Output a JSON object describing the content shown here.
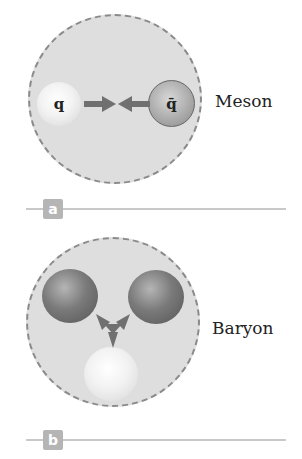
{
  "panels": [
    {
      "id": "a",
      "tag": "a",
      "label": "Meson",
      "quarks": [
        {
          "symbol": "q",
          "shade": "light"
        },
        {
          "symbol": "q̄",
          "shade": "mid"
        }
      ],
      "arrows": "two arrows pointing toward each other"
    },
    {
      "id": "b",
      "tag": "b",
      "label": "Baryon",
      "quarks": [
        {
          "symbol": "",
          "shade": "dark"
        },
        {
          "symbol": "",
          "shade": "dark"
        },
        {
          "symbol": "",
          "shade": "light"
        }
      ],
      "arrows": "three arrows pointing to center"
    }
  ],
  "colors": {
    "hadron_fill": "#dedede",
    "hadron_border": "#8a8a8a",
    "arrow": "#707070",
    "tag_bg": "#b5b5b5",
    "rule": "#c8c8c8"
  }
}
